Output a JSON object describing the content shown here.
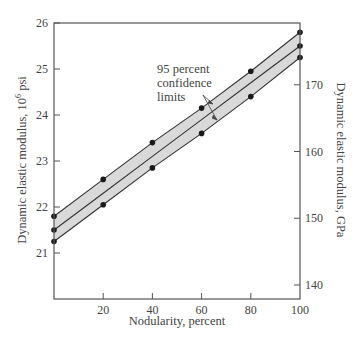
{
  "chart_data": {
    "type": "line",
    "title": "",
    "xlabel": "Nodularity, percent",
    "ylabel": "Dynamic elastic modulus, 10^6 psi",
    "ylabel_right": "Dynamic elastic modulus, GPa",
    "xlim": [
      0,
      100
    ],
    "ylim": [
      20,
      26
    ],
    "ylim_right": [
      137.9,
      179.3
    ],
    "x_ticks": [
      20,
      40,
      60,
      80,
      100
    ],
    "y_ticks": [
      21,
      22,
      23,
      24,
      25,
      26
    ],
    "y_ticks_right": [
      140,
      150,
      160,
      170
    ],
    "grid": false,
    "legend": null,
    "annotation": "95 percent confidence limits",
    "x": [
      0,
      20,
      40,
      60,
      80,
      100
    ],
    "series": [
      {
        "name": "Upper 95% confidence limit",
        "values": [
          21.8,
          22.6,
          23.4,
          24.15,
          24.95,
          25.8
        ],
        "markers_at": [
          0,
          20,
          40,
          60,
          80,
          100
        ]
      },
      {
        "name": "Mean",
        "values": [
          21.5,
          22.3,
          23.1,
          23.9,
          24.7,
          25.5
        ],
        "markers_at": [
          0,
          100
        ]
      },
      {
        "name": "Lower 95% confidence limit",
        "values": [
          21.25,
          22.05,
          22.85,
          23.6,
          24.4,
          25.25
        ],
        "markers_at": [
          0,
          20,
          40,
          60,
          80,
          100
        ]
      }
    ]
  },
  "labels": {
    "xlabel": "Nodularity, percent",
    "ylabel_left": "Dynamic elastic modulus, 10",
    "ylabel_left_sup": "6",
    "ylabel_left_unit": " psi",
    "ylabel_right": "Dynamic elastic modulus, GPa",
    "annotation_line1": "95 percent",
    "annotation_line2": "confidence",
    "annotation_line3": "limits"
  }
}
